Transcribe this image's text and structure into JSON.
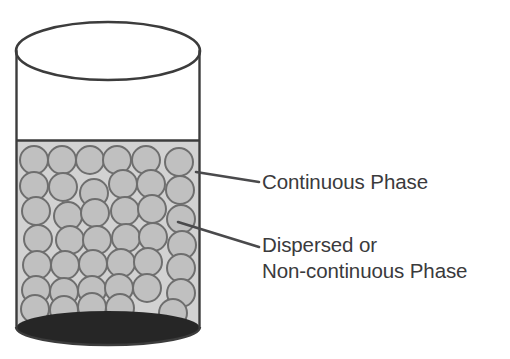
{
  "figure": {
    "background_color": "#ffffff"
  },
  "vessel": {
    "name": "cylinder-container",
    "outline_color": "#3c3c3c",
    "empty_headspace_color": "#ffffff",
    "liquid_fill_color": "#d2d2d2",
    "bottom_ellipse_color": "#262626",
    "liquid_surface_label": "liquid-surface-line"
  },
  "particles": {
    "name": "dispersed-droplets",
    "fill_color": "#c0c0c0",
    "stroke_color": "#6e6e6e",
    "count": 41,
    "radius": 14,
    "positions": [
      [
        34,
        160
      ],
      [
        62,
        160
      ],
      [
        90,
        160
      ],
      [
        117,
        160
      ],
      [
        146,
        160
      ],
      [
        179,
        162
      ],
      [
        34,
        186
      ],
      [
        63,
        187
      ],
      [
        94,
        193
      ],
      [
        123,
        184
      ],
      [
        151,
        184
      ],
      [
        180,
        190
      ],
      [
        36,
        211
      ],
      [
        68,
        216
      ],
      [
        95,
        213
      ],
      [
        125,
        211
      ],
      [
        152,
        209
      ],
      [
        181,
        219
      ],
      [
        38,
        239
      ],
      [
        70,
        240
      ],
      [
        97,
        240
      ],
      [
        126,
        238
      ],
      [
        153,
        237
      ],
      [
        182,
        245
      ],
      [
        37,
        265
      ],
      [
        65,
        265
      ],
      [
        93,
        264
      ],
      [
        121,
        263
      ],
      [
        148,
        262
      ],
      [
        181,
        268
      ],
      [
        36,
        290
      ],
      [
        64,
        292
      ],
      [
        92,
        290
      ],
      [
        119,
        288
      ],
      [
        147,
        288
      ],
      [
        181,
        293
      ],
      [
        35,
        309
      ],
      [
        64,
        310
      ],
      [
        92,
        307
      ],
      [
        120,
        308
      ],
      [
        173,
        313
      ]
    ]
  },
  "callouts": [
    {
      "id": "continuous-phase",
      "label": "Continuous Phase",
      "lines": [
        "Continuous Phase"
      ],
      "leader_from": [
        196,
        172
      ],
      "leader_to": [
        259,
        182
      ],
      "text_color": "#3a3a3c"
    },
    {
      "id": "dispersed-phase",
      "label": "Dispersed or Non-continuous Phase",
      "lines": [
        "Dispersed or",
        "Non-continuous Phase"
      ],
      "leader_from": [
        178,
        222
      ],
      "leader_to": [
        259,
        247
      ],
      "text_color": "#3a3a3c"
    }
  ],
  "labels": {
    "continuous_phase": "Continuous Phase",
    "dispersed_line_1": "Dispersed or",
    "dispersed_line_2": "Non-continuous Phase"
  },
  "colors": {
    "outline": "#3c3c3c",
    "liquid": "#d2d2d2",
    "droplet_fill": "#c0c0c0",
    "droplet_stroke": "#6e6e6e",
    "sediment": "#262626",
    "text": "#3a3a3c",
    "leader": "#4a4a4c"
  }
}
